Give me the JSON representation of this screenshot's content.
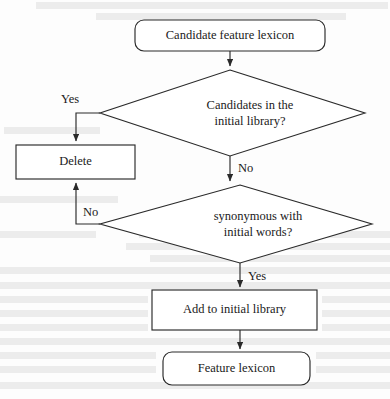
{
  "figure": {
    "type": "flowchart",
    "background_color": "#fdfdfd",
    "line_color": "#2a2a2a",
    "text_color": "#1a1a1a",
    "width": 390,
    "height": 399
  },
  "nodes": {
    "start": {
      "label": "Candidate feature lexicon",
      "shape": "rounded-rectangle"
    },
    "decision1_line1": {
      "label": "Candidates in the"
    },
    "decision1_line2": {
      "label": "initial library?"
    },
    "delete": {
      "label": "Delete",
      "shape": "rectangle"
    },
    "decision2_line1": {
      "label": "synonymous with"
    },
    "decision2_line2": {
      "label": "initial words?"
    },
    "add": {
      "label": "Add to initial library",
      "shape": "rectangle"
    },
    "end": {
      "label": "Feature lexicon",
      "shape": "rounded-rectangle"
    }
  },
  "edge_labels": {
    "decision1_yes": "Yes",
    "decision1_no": "No",
    "decision2_no": "No",
    "decision2_yes": "Yes"
  },
  "background_bleed": [
    {
      "x": 36,
      "y": 2,
      "w": 352
    },
    {
      "x": 96,
      "y": 13,
      "w": 250
    },
    {
      "x": 4,
      "y": 127,
      "w": 96
    },
    {
      "x": 0,
      "y": 196,
      "w": 118
    },
    {
      "x": 0,
      "y": 231,
      "w": 96
    },
    {
      "x": 139,
      "y": 231,
      "w": 251
    },
    {
      "x": 126,
      "y": 243,
      "w": 264
    },
    {
      "x": 150,
      "y": 255,
      "w": 240
    },
    {
      "x": 0,
      "y": 267,
      "w": 390
    },
    {
      "x": 0,
      "y": 282,
      "w": 390
    },
    {
      "x": 0,
      "y": 296,
      "w": 148
    },
    {
      "x": 322,
      "y": 296,
      "w": 68
    },
    {
      "x": 0,
      "y": 310,
      "w": 148
    },
    {
      "x": 322,
      "y": 310,
      "w": 68
    },
    {
      "x": 0,
      "y": 324,
      "w": 148
    },
    {
      "x": 322,
      "y": 324,
      "w": 68
    },
    {
      "x": 0,
      "y": 338,
      "w": 390
    },
    {
      "x": 0,
      "y": 352,
      "w": 156
    },
    {
      "x": 316,
      "y": 352,
      "w": 74
    },
    {
      "x": 0,
      "y": 366,
      "w": 156
    },
    {
      "x": 316,
      "y": 366,
      "w": 74
    },
    {
      "x": 0,
      "y": 382,
      "w": 390
    }
  ]
}
